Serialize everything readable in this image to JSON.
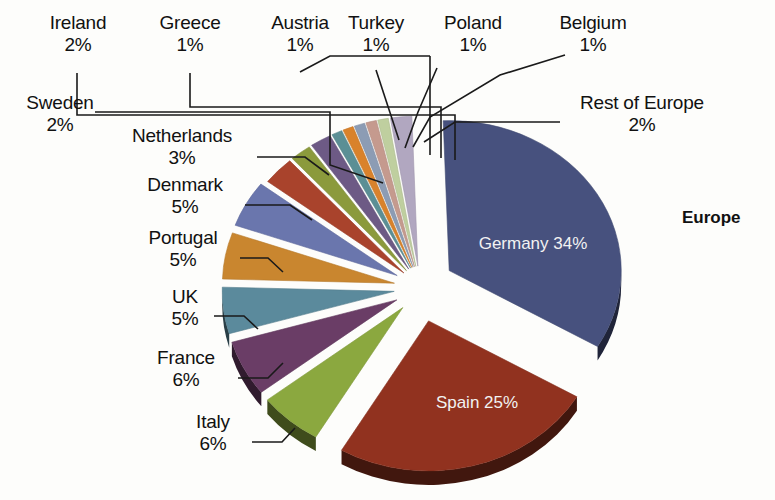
{
  "chart_data": {
    "type": "pie",
    "title": "Europe",
    "exploded": true,
    "three_d": true,
    "units": "percent",
    "categories": [
      "Germany",
      "Spain",
      "Italy",
      "France",
      "UK",
      "Portugal",
      "Denmark",
      "Netherlands",
      "Sweden",
      "Ireland",
      "Greece",
      "Austria",
      "Turkey",
      "Poland",
      "Belgium",
      "Rest of Europe"
    ],
    "values": [
      34,
      25,
      6,
      6,
      5,
      5,
      5,
      3,
      2,
      2,
      1,
      1,
      1,
      1,
      1,
      2
    ],
    "value_labels": [
      "34%",
      "25%",
      "6%",
      "6%",
      "5%",
      "5%",
      "5%",
      "3%",
      "2%",
      "2%",
      "1%",
      "1%",
      "1%",
      "1%",
      "1%",
      "2%"
    ],
    "colors": [
      "#47517e",
      "#91321f",
      "#8ba83f",
      "#6a3d66",
      "#5b8a9c",
      "#c9862f",
      "#6a76ad",
      "#a9432c",
      "#8b9a3c",
      "#6d5a85",
      "#5b8f95",
      "#d9822b",
      "#8c9cb4",
      "#c59a8e",
      "#bfcf9f",
      "#b1a7c0"
    ],
    "slices": [
      {
        "label": "Germany",
        "value": 34,
        "value_label": "34%",
        "color": "#47517e",
        "label_position": "inside"
      },
      {
        "label": "Spain",
        "value": 25,
        "value_label": "25%",
        "color": "#91321f",
        "label_position": "inside"
      },
      {
        "label": "Italy",
        "value": 6,
        "value_label": "6%",
        "color": "#8ba83f",
        "label_position": "outside"
      },
      {
        "label": "France",
        "value": 6,
        "value_label": "6%",
        "color": "#6a3d66",
        "label_position": "outside"
      },
      {
        "label": "UK",
        "value": 5,
        "value_label": "5%",
        "color": "#5b8a9c",
        "label_position": "outside"
      },
      {
        "label": "Portugal",
        "value": 5,
        "value_label": "5%",
        "color": "#c9862f",
        "label_position": "outside"
      },
      {
        "label": "Denmark",
        "value": 5,
        "value_label": "5%",
        "color": "#6a76ad",
        "label_position": "outside"
      },
      {
        "label": "Netherlands",
        "value": 3,
        "value_label": "3%",
        "color": "#a9432c",
        "label_position": "outside"
      },
      {
        "label": "Sweden",
        "value": 2,
        "value_label": "2%",
        "color": "#8b9a3c",
        "label_position": "outside"
      },
      {
        "label": "Ireland",
        "value": 2,
        "value_label": "2%",
        "color": "#6d5a85",
        "label_position": "outside"
      },
      {
        "label": "Greece",
        "value": 1,
        "value_label": "1%",
        "color": "#5b8f95",
        "label_position": "outside"
      },
      {
        "label": "Austria",
        "value": 1,
        "value_label": "1%",
        "color": "#d9822b",
        "label_position": "outside"
      },
      {
        "label": "Turkey",
        "value": 1,
        "value_label": "1%",
        "color": "#8c9cb4",
        "label_position": "outside"
      },
      {
        "label": "Poland",
        "value": 1,
        "value_label": "1%",
        "color": "#c59a8e",
        "label_position": "outside"
      },
      {
        "label": "Belgium",
        "value": 1,
        "value_label": "1%",
        "color": "#bfcf9f",
        "label_position": "outside"
      },
      {
        "label": "Rest of Europe",
        "value": 2,
        "value_label": "2%",
        "color": "#b1a7c0",
        "label_position": "outside"
      }
    ],
    "legend": "none",
    "grid": false
  },
  "callouts": {
    "ireland": {
      "name": "Ireland",
      "pct": "2%"
    },
    "greece": {
      "name": "Greece",
      "pct": "1%"
    },
    "austria": {
      "name": "Austria",
      "pct": "1%"
    },
    "turkey": {
      "name": "Turkey",
      "pct": "1%"
    },
    "poland": {
      "name": "Poland",
      "pct": "1%"
    },
    "belgium": {
      "name": "Belgium",
      "pct": "1%"
    },
    "rest_of_europe": {
      "name": "Rest of Europe",
      "pct": "2%"
    },
    "sweden": {
      "name": "Sweden",
      "pct": "2%"
    },
    "netherlands": {
      "name": "Netherlands",
      "pct": "3%"
    },
    "denmark": {
      "name": "Denmark",
      "pct": "5%"
    },
    "portugal": {
      "name": "Portugal",
      "pct": "5%"
    },
    "uk": {
      "name": "UK",
      "pct": "5%"
    },
    "france": {
      "name": "France",
      "pct": "6%"
    },
    "italy": {
      "name": "Italy",
      "pct": "6%"
    }
  },
  "inside_labels": {
    "germany": {
      "name": "Germany",
      "pct": "34%"
    },
    "spain": {
      "name": "Spain",
      "pct": "25%"
    }
  },
  "title": {
    "text": "Europe"
  }
}
